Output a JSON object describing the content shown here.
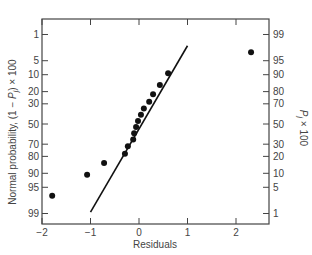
{
  "chart_data": {
    "type": "scatter",
    "title": "",
    "xlabel": "Residuals",
    "ylabel_left": "Normal probability, (1 − P_j) × 100",
    "ylabel_right": "P_j × 100",
    "xlim": [
      -2,
      2.67
    ],
    "x_ticks": [
      -2,
      -1,
      0,
      1,
      2
    ],
    "x_tick_labels": [
      "−2",
      "−1",
      "0",
      "1",
      "2"
    ],
    "y_scale": "normal-probability",
    "y_left_ticks": [
      1,
      5,
      10,
      20,
      30,
      50,
      70,
      80,
      90,
      95,
      99
    ],
    "y_right_ticks": [
      99,
      95,
      90,
      80,
      70,
      50,
      30,
      20,
      10,
      5,
      1
    ],
    "grid": false,
    "legend": null,
    "series": [
      {
        "name": "Residuals",
        "kind": "points",
        "x": [
          -1.79,
          -1.07,
          -0.72,
          -0.29,
          -0.23,
          -0.12,
          -0.1,
          -0.06,
          -0.02,
          0.04,
          0.1,
          0.21,
          0.29,
          0.43,
          0.6,
          2.31
        ],
        "y_left_percent": [
          96.9,
          90.6,
          84.4,
          78.1,
          71.9,
          65.6,
          59.4,
          53.1,
          46.9,
          40.6,
          34.4,
          28.1,
          21.9,
          15.6,
          9.4,
          3.1
        ]
      },
      {
        "name": "Reference line",
        "kind": "line",
        "x": [
          -1.0,
          1.0
        ],
        "y_left_percent": [
          98.9,
          2.1
        ]
      }
    ]
  },
  "labels": {
    "xlabel": "Residuals",
    "ylabel_left_main": "Normal probability, (1 − ",
    "ylabel_left_p": "P",
    "ylabel_left_j": "j",
    "ylabel_left_tail": ") × 100",
    "ylabel_right_p": "P",
    "ylabel_right_j": "j",
    "ylabel_right_tail": " × 100"
  },
  "colors": {
    "axis": "#444444",
    "points": "#111111",
    "line": "#111111",
    "text": "#444444"
  }
}
